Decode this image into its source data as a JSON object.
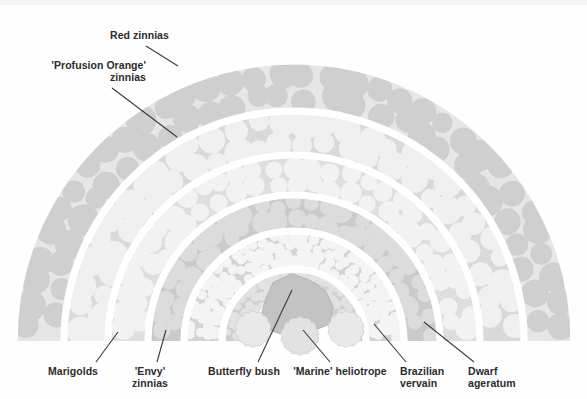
{
  "figure": {
    "type": "garden-planting-plan",
    "shape": "semicircular tiered bed",
    "background_color": "#ffffff"
  },
  "palette": {
    "ring_light": "#e8e8e8",
    "ring_mid": "#d8d8d8",
    "ring_dark": "#c6c6c6",
    "blob_light": "#efefef",
    "blob_pale": "#f5f5f5",
    "blob_mid": "#d2d2d2",
    "blob_dark": "#bdbdbd",
    "separator": "#ffffff",
    "text": "#2b2b2b",
    "leader": "#3a3a3a"
  },
  "labels": [
    {
      "id": "red-zinnias",
      "text": "Red zinnias",
      "lines": [
        "Red zinnias"
      ],
      "align": "left",
      "x": 110,
      "y": 30,
      "leader": {
        "x1": 146,
        "y1": 46,
        "x2": 178,
        "y2": 66
      }
    },
    {
      "id": "profusion-orange-zinnias",
      "text": "'Profusion Orange' zinnias",
      "lines": [
        "'Profusion Orange'",
        "zinnias"
      ],
      "align": "right",
      "x": 22,
      "y": 60,
      "width": 124,
      "leader": {
        "x1": 112,
        "y1": 88,
        "x2": 177,
        "y2": 137
      }
    },
    {
      "id": "marigolds",
      "text": "Marigolds",
      "lines": [
        "Marigolds"
      ],
      "align": "center",
      "x": 42,
      "y": 366,
      "width": 62,
      "leader": {
        "x1": 96,
        "y1": 362,
        "x2": 118,
        "y2": 332
      }
    },
    {
      "id": "envy-zinnias",
      "text": "'Envy' zinnias",
      "lines": [
        "'Envy'",
        "zinnias"
      ],
      "align": "center",
      "x": 122,
      "y": 366,
      "width": 56,
      "leader": {
        "x1": 157,
        "y1": 362,
        "x2": 166,
        "y2": 330
      }
    },
    {
      "id": "butterfly-bush",
      "text": "Butterfly bush",
      "lines": [
        "Butterfly bush"
      ],
      "align": "center",
      "x": 203,
      "y": 366,
      "width": 82,
      "leader": {
        "x1": 258,
        "y1": 362,
        "x2": 292,
        "y2": 290
      }
    },
    {
      "id": "marine-heliotrope",
      "text": "'Marine' heliotrope",
      "lines": [
        "'Marine' heliotrope"
      ],
      "align": "center",
      "x": 290,
      "y": 366,
      "width": 100,
      "leader": {
        "x1": 330,
        "y1": 362,
        "x2": 303,
        "y2": 330
      }
    },
    {
      "id": "brazilian-vervain",
      "text": "Brazilian vervain",
      "lines": [
        "Brazilian",
        "vervain"
      ],
      "align": "left",
      "x": 400,
      "y": 366,
      "width": 60,
      "leader": {
        "x1": 406,
        "y1": 362,
        "x2": 374,
        "y2": 324
      }
    },
    {
      "id": "dwarf-ageratum",
      "text": "Dwarf ageratum",
      "lines": [
        "Dwarf",
        "ageratum"
      ],
      "align": "left",
      "x": 468,
      "y": 366,
      "width": 68,
      "leader": {
        "x1": 474,
        "y1": 362,
        "x2": 424,
        "y2": 322
      }
    }
  ],
  "bands": [
    {
      "id": "band-red-zinnias",
      "plant": "Red zinnias",
      "order": 1,
      "position": "outermost",
      "outer_radius": 278,
      "inner_radius": 232,
      "band_fill": "#e6e6e6",
      "blob_fill": "#cfcfcf",
      "blob_size": "large",
      "blob_radius": 13
    },
    {
      "id": "band-profusion-orange-zinnias",
      "plant": "'Profusion Orange' zinnias",
      "order": 2,
      "outer_radius": 228,
      "inner_radius": 188,
      "band_fill": "#d9d9d9",
      "blob_fill": "#f0f0f0",
      "blob_size": "large",
      "blob_radius": 12
    },
    {
      "id": "band-marigolds",
      "plant": "Marigolds",
      "order": 3,
      "outer_radius": 184,
      "inner_radius": 148,
      "band_fill": "#dedede",
      "blob_fill": "#f2f2f2",
      "blob_size": "medium",
      "blob_radius": 10
    },
    {
      "id": "band-envy-zinnias",
      "plant": "'Envy' zinnias",
      "order": 4,
      "outer_radius": 144,
      "inner_radius": 112,
      "band_fill": "#cacaca",
      "blob_fill": "#dcdcdc",
      "blob_size": "medium",
      "blob_radius": 9
    },
    {
      "id": "band-dwarf-ageratum",
      "plant": "Dwarf ageratum",
      "order": 5,
      "outer_radius": 108,
      "inner_radius": 74,
      "band_fill": "#d4d4d4",
      "blob_fill": "#f4f4f4",
      "blob_size": "small",
      "blob_radius": 5.5
    },
    {
      "id": "band-brazilian-vervain",
      "plant": "Brazilian vervain",
      "order": 6,
      "position": "innermost",
      "outer_radius": 70,
      "inner_radius": 44,
      "band_fill": "#cfcfcf",
      "blob_fill": "#e2e2e2",
      "blob_size": "tiny",
      "blob_radius": 4.5
    }
  ],
  "center_features": [
    {
      "id": "butterfly-bush-clump",
      "plant": "Butterfly bush",
      "shape": "irregular-polygon",
      "fill": "#c3c3c3",
      "cx": 298,
      "cy": 306,
      "rx": 36,
      "ry": 30
    },
    {
      "id": "heliotrope-clump-left",
      "plant": "'Marine' heliotrope",
      "shape": "scalloped-circle",
      "fill": "#e9e9e9",
      "cx": 253,
      "cy": 329,
      "r": 19
    },
    {
      "id": "heliotrope-clump-center",
      "plant": "'Marine' heliotrope",
      "shape": "scalloped-circle",
      "fill": "#e2e2e2",
      "cx": 300,
      "cy": 336,
      "r": 20
    },
    {
      "id": "heliotrope-clump-right",
      "plant": "'Marine' heliotrope",
      "shape": "scalloped-circle",
      "fill": "#e9e9e9",
      "cx": 346,
      "cy": 329,
      "r": 19
    }
  ],
  "geometry": {
    "center_x": 294,
    "center_y": 341,
    "baseline_y": 341
  }
}
